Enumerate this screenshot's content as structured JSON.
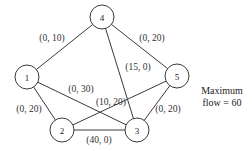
{
  "nodes": [
    {
      "id": "1",
      "x": 27,
      "y": 77
    },
    {
      "id": "2",
      "x": 62,
      "y": 130
    },
    {
      "id": "3",
      "x": 137,
      "y": 130
    },
    {
      "id": "4",
      "x": 102,
      "y": 17
    },
    {
      "id": "5",
      "x": 177,
      "y": 76
    }
  ],
  "edges": [
    {
      "from": "1",
      "to": "4",
      "label": "(0, 10)",
      "lx": 52,
      "ly": 38
    },
    {
      "from": "4",
      "to": "5",
      "label": "(0, 20)",
      "lx": 152,
      "ly": 38
    },
    {
      "from": "4",
      "to": "3",
      "label": "(15, 0)",
      "lx": 138,
      "ly": 67
    },
    {
      "from": "1",
      "to": "3",
      "label": "(0, 30)",
      "lx": 81,
      "ly": 89
    },
    {
      "from": "2",
      "to": "5",
      "label": "(10, 20)",
      "lx": 111,
      "ly": 102
    },
    {
      "from": "1",
      "to": "2",
      "label": "(0, 20)",
      "lx": 29,
      "ly": 109
    },
    {
      "from": "5",
      "to": "3",
      "label": "(0, 20)",
      "lx": 168,
      "ly": 109
    },
    {
      "from": "2",
      "to": "3",
      "label": "(40, 0)",
      "lx": 99,
      "ly": 140
    }
  ],
  "note": {
    "line1": "Maximum",
    "line2": "flow = 60"
  }
}
